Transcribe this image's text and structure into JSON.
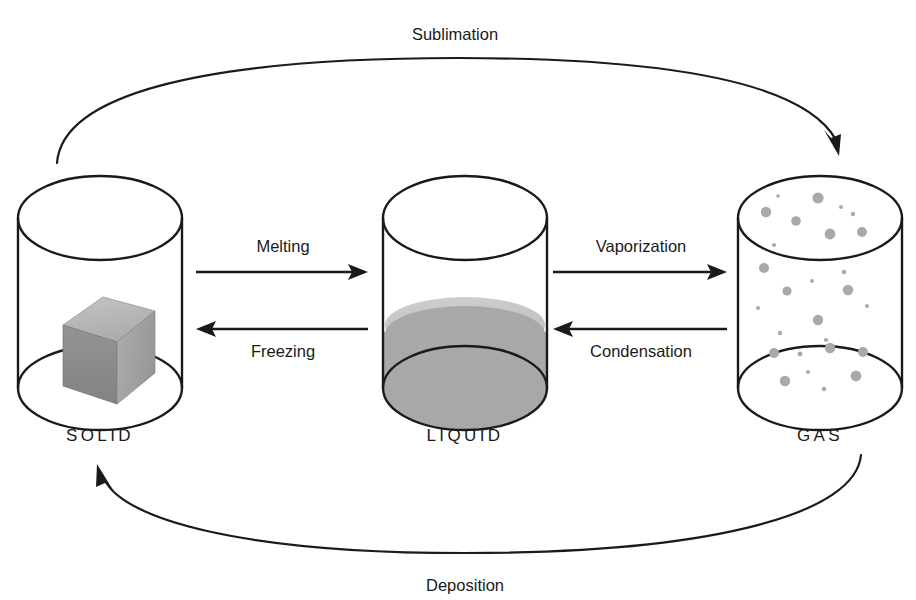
{
  "diagram": {
    "background_color": "#ffffff",
    "line_color": "#1a1a1a"
  },
  "states": [
    {
      "id": "solid",
      "label": "SOLID",
      "label_x": 100,
      "label_y": 441,
      "vessel": {
        "cx": 100,
        "top_cy": 218,
        "bottom_cy": 388,
        "rx": 82,
        "ry": 42
      },
      "contents": "ice-cube",
      "cube_colors": {
        "top": "#b5b5b5",
        "front": "#8c8c8c",
        "right": "#a2a2a2",
        "edge": "#6e6e6e"
      }
    },
    {
      "id": "liquid",
      "label": "LIQUID",
      "label_x": 465,
      "label_y": 441,
      "vessel": {
        "cx": 465,
        "top_cy": 218,
        "bottom_cy": 388,
        "rx": 82,
        "ry": 42
      },
      "contents": "liquid-fill",
      "fill_level_cy": 332,
      "liquid_colors": {
        "surface": "#c3c3c3",
        "body": "#a8a8a8"
      }
    },
    {
      "id": "gas",
      "label": "GAS",
      "label_x": 820,
      "label_y": 441,
      "vessel": {
        "cx": 820,
        "top_cy": 218,
        "bottom_cy": 388,
        "rx": 82,
        "ry": 42
      },
      "contents": "gas-particles",
      "particle_color": "#a9a9a9"
    }
  ],
  "gas_particles": [
    {
      "cx": 766,
      "cy": 212,
      "r": 5.2
    },
    {
      "cx": 796,
      "cy": 221,
      "r": 4.8
    },
    {
      "cx": 818,
      "cy": 198,
      "r": 5.6
    },
    {
      "cx": 841,
      "cy": 207,
      "r": 2.0
    },
    {
      "cx": 853,
      "cy": 214,
      "r": 2.2
    },
    {
      "cx": 830,
      "cy": 234,
      "r": 5.4
    },
    {
      "cx": 862,
      "cy": 232,
      "r": 5.0
    },
    {
      "cx": 778,
      "cy": 196,
      "r": 1.8
    },
    {
      "cx": 774,
      "cy": 245,
      "r": 2.0
    },
    {
      "cx": 764,
      "cy": 268,
      "r": 5.0
    },
    {
      "cx": 787,
      "cy": 291,
      "r": 4.6
    },
    {
      "cx": 812,
      "cy": 281,
      "r": 2.0
    },
    {
      "cx": 844,
      "cy": 272,
      "r": 2.3
    },
    {
      "cx": 848,
      "cy": 290,
      "r": 5.2
    },
    {
      "cx": 867,
      "cy": 306,
      "r": 2.0
    },
    {
      "cx": 758,
      "cy": 308,
      "r": 2.0
    },
    {
      "cx": 818,
      "cy": 320,
      "r": 5.2
    },
    {
      "cx": 780,
      "cy": 333,
      "r": 2.2
    },
    {
      "cx": 826,
      "cy": 340,
      "r": 2.1
    },
    {
      "cx": 800,
      "cy": 354,
      "r": 2.4
    },
    {
      "cx": 830,
      "cy": 348,
      "r": 5.2
    },
    {
      "cx": 774,
      "cy": 353,
      "r": 5.0
    },
    {
      "cx": 863,
      "cy": 352,
      "r": 5.0
    },
    {
      "cx": 808,
      "cy": 372,
      "r": 2.1
    },
    {
      "cx": 785,
      "cy": 381,
      "r": 5.2
    },
    {
      "cx": 856,
      "cy": 376,
      "r": 5.4
    },
    {
      "cx": 824,
      "cy": 389,
      "r": 2.2
    }
  ],
  "processes": [
    {
      "id": "melting",
      "label": "Melting",
      "direction": "right",
      "label_x": 283,
      "label_y": 252,
      "line_y": 272,
      "x_start": 196,
      "x_end": 368
    },
    {
      "id": "vaporization",
      "label": "Vaporization",
      "direction": "right",
      "label_x": 641,
      "label_y": 252,
      "line_y": 272,
      "x_start": 553,
      "x_end": 727
    },
    {
      "id": "freezing",
      "label": "Freezing",
      "direction": "left",
      "label_x": 283,
      "label_y": 357,
      "line_y": 329,
      "x_start": 196,
      "x_end": 368
    },
    {
      "id": "condensation",
      "label": "Condensation",
      "direction": "left",
      "label_x": 641,
      "label_y": 357,
      "line_y": 329,
      "x_start": 553,
      "x_end": 727
    }
  ],
  "curved_processes": [
    {
      "id": "sublimation",
      "label": "Sublimation",
      "label_x": 455,
      "label_y": 40,
      "from": "solid",
      "to": "gas",
      "path": "M 57,163 C 62,96 196,58 458,58 C 720,58 812,96 836,140",
      "arrow_x": 836,
      "arrow_y": 152,
      "arrow_angle": 118
    },
    {
      "id": "deposition",
      "label": "Deposition",
      "label_x": 465,
      "label_y": 591,
      "from": "gas",
      "to": "solid",
      "path": "M 861,455 C 856,512 720,553 465,553 C 236,553 126,518 105,478",
      "arrow_x": 99,
      "arrow_y": 466,
      "arrow_angle": -61
    }
  ]
}
